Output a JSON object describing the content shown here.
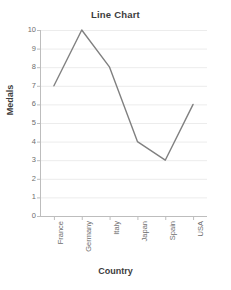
{
  "chart_data": {
    "type": "line",
    "title": "Line Chart",
    "xlabel": "Country",
    "ylabel": "Medals",
    "categories": [
      "France",
      "Germany",
      "Italy",
      "Japan",
      "Spain",
      "USA"
    ],
    "values": [
      7,
      10,
      8,
      4,
      3,
      6
    ],
    "series": [
      {
        "name": "Medals",
        "values": [
          7,
          10,
          8,
          4,
          3,
          6
        ]
      }
    ],
    "ylim": [
      0,
      10
    ],
    "ytick_labels": [
      "0",
      "1",
      "2",
      "3",
      "4",
      "5",
      "6",
      "7",
      "8",
      "9",
      "10"
    ],
    "ytick_values": [
      0,
      1,
      2,
      3,
      4,
      5,
      6,
      7,
      8,
      9,
      10
    ],
    "grid": true,
    "grid_axis": "y",
    "legend": false,
    "legend_position": "none",
    "markers": false,
    "colors": {
      "line": "#808080",
      "grid": "#ececec",
      "axis": "#bdbdbd",
      "tick_label": "#6e6e6e",
      "title": "#3c3c3c",
      "background": "#ffffff"
    }
  }
}
